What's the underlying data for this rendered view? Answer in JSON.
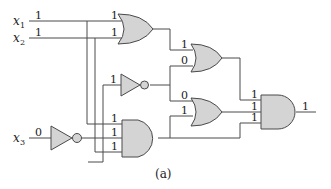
{
  "caption": "(a)",
  "inputs": {
    "x1": {
      "name": "x",
      "sub": "1",
      "value": "1"
    },
    "x2": {
      "name": "x",
      "sub": "2",
      "value": "1"
    },
    "x3": {
      "name": "x",
      "sub": "3",
      "value": "0"
    }
  },
  "gates": {
    "or1": {
      "type": "OR",
      "in": [
        "1",
        "1"
      ]
    },
    "not1": {
      "type": "NOT",
      "in": [
        "1"
      ]
    },
    "not3": {
      "type": "NOT",
      "in": [
        "0"
      ]
    },
    "and1": {
      "type": "AND",
      "in": [
        "1",
        "1",
        "1"
      ]
    },
    "or2": {
      "type": "OR",
      "in": [
        "1",
        "0"
      ]
    },
    "or3": {
      "type": "OR",
      "in": [
        "0",
        "1"
      ]
    },
    "and_final": {
      "type": "AND",
      "in": [
        "1",
        "1",
        "1"
      ],
      "out": "1"
    }
  },
  "colors": {
    "gate_fill": "#d4d4d4",
    "wire": "#4a4a4a"
  }
}
